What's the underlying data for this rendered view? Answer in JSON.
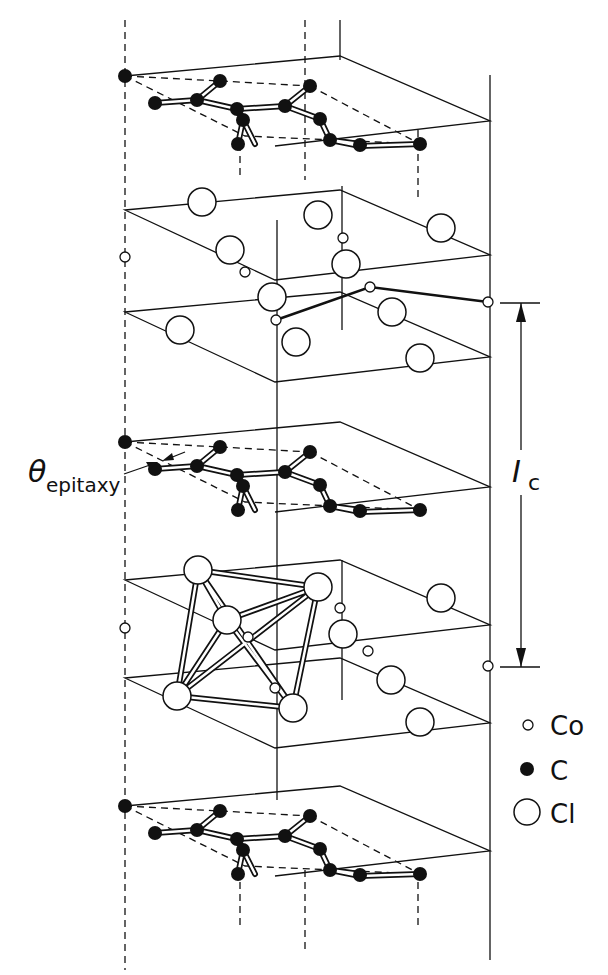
{
  "figure": {
    "labels": {
      "theta_symbol": "θ",
      "theta_subscript": "epitaxy",
      "ic_symbol": "I",
      "ic_subscript": "c"
    },
    "legend": [
      {
        "symbol": "small-open-circle",
        "label": "Co"
      },
      {
        "symbol": "filled-circle",
        "label": "C"
      },
      {
        "symbol": "large-open-circle",
        "label": "Cl"
      }
    ],
    "layers": [
      {
        "type": "graphite",
        "atom": "C"
      },
      {
        "type": "intercalate",
        "atoms": [
          "Cl",
          "Co",
          "Cl"
        ]
      },
      {
        "type": "graphite",
        "atom": "C"
      },
      {
        "type": "intercalate",
        "atoms": [
          "Cl",
          "Co",
          "Cl"
        ],
        "note": "CoCl6 octahedron drawn"
      },
      {
        "type": "graphite",
        "atom": "C"
      }
    ],
    "colors": {
      "ink": "#111111",
      "background": "#ffffff"
    }
  }
}
